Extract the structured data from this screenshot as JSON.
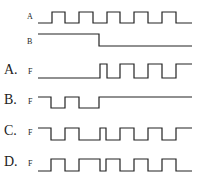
{
  "diagram": {
    "inputs": [
      {
        "label": "A",
        "label_x": 27,
        "label_y": 19,
        "label_size": 8,
        "high_y": 12,
        "low_y": 23,
        "start_level": "low",
        "x_start": 38,
        "x_end": 192,
        "transitions": [
          52,
          65,
          79,
          93,
          107,
          120,
          134,
          148,
          162,
          176
        ]
      },
      {
        "label": "B",
        "label_x": 27,
        "label_y": 44,
        "label_size": 8,
        "high_y": 34,
        "low_y": 46,
        "start_level": "high",
        "x_start": 38,
        "x_end": 192,
        "transitions": [
          99
        ]
      }
    ],
    "options": [
      {
        "option": "A.",
        "signal": "F",
        "opt_x": 4,
        "opt_y": 74,
        "sig_x": 28,
        "high_y": 64,
        "low_y": 78,
        "start_level": "low",
        "x_start": 38,
        "x_end": 192,
        "transitions": [
          100,
          107,
          120,
          134,
          148,
          162,
          176
        ]
      },
      {
        "option": "B.",
        "signal": "F",
        "opt_x": 4,
        "opt_y": 104,
        "sig_x": 28,
        "high_y": 97,
        "low_y": 108,
        "start_level": "high",
        "x_start": 38,
        "x_end": 192,
        "transitions": [
          51,
          65,
          79,
          99
        ]
      },
      {
        "option": "C.",
        "signal": "F",
        "opt_x": 4,
        "opt_y": 135,
        "sig_x": 28,
        "high_y": 128,
        "low_y": 140,
        "start_level": "high",
        "x_start": 38,
        "x_end": 192,
        "transitions": [
          51,
          65,
          79,
          100,
          106,
          120,
          134,
          148,
          162,
          176
        ]
      },
      {
        "option": "D.",
        "signal": "F",
        "opt_x": 4,
        "opt_y": 166,
        "sig_x": 28,
        "high_y": 159,
        "low_y": 171,
        "start_level": "low",
        "x_start": 38,
        "x_end": 192,
        "transitions": [
          51,
          65,
          79,
          100,
          106,
          120,
          134,
          148,
          162,
          176
        ]
      }
    ]
  }
}
